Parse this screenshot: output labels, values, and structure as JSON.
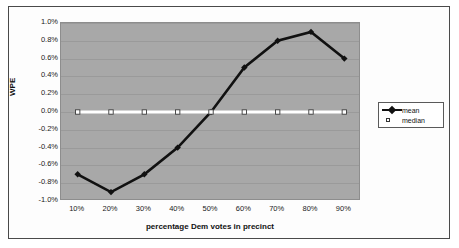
{
  "chart_data": {
    "type": "line",
    "title": "",
    "xlabel": "percentage Dem votes in precinct",
    "ylabel": "WPE",
    "categories": [
      "10%",
      "20%",
      "30%",
      "40%",
      "50%",
      "60%",
      "70%",
      "80%",
      "90%"
    ],
    "series": [
      {
        "name": "mean",
        "values": [
          -0.7,
          -0.9,
          -0.7,
          -0.4,
          0.0,
          0.5,
          0.8,
          0.9,
          0.6
        ],
        "color": "#111111",
        "marker": "diamond"
      },
      {
        "name": "median",
        "values": [
          0.0,
          0.0,
          0.0,
          0.0,
          0.0,
          0.0,
          0.0,
          0.0,
          0.0
        ],
        "color": "#ffffff",
        "marker": "open-square"
      }
    ],
    "ylim": [
      -1.0,
      1.0
    ],
    "ytick_values": [
      1.0,
      0.8,
      0.6,
      0.4,
      0.2,
      0.0,
      -0.2,
      -0.4,
      -0.6,
      -0.8,
      -1.0
    ],
    "ytick_labels": [
      "1.0%",
      "0.8%",
      "0.6%",
      "0.4%",
      "0.2%",
      "0.0%",
      "-0.2%",
      "-0.4%",
      "-0.6%",
      "-0.8%",
      "-1.0%"
    ],
    "grid": true,
    "legend_position": "right",
    "plot_background": "#a8a8a8",
    "figure_background": "#ffffff"
  },
  "legend": {
    "entries": [
      {
        "label": "mean"
      },
      {
        "label": "median"
      }
    ]
  }
}
